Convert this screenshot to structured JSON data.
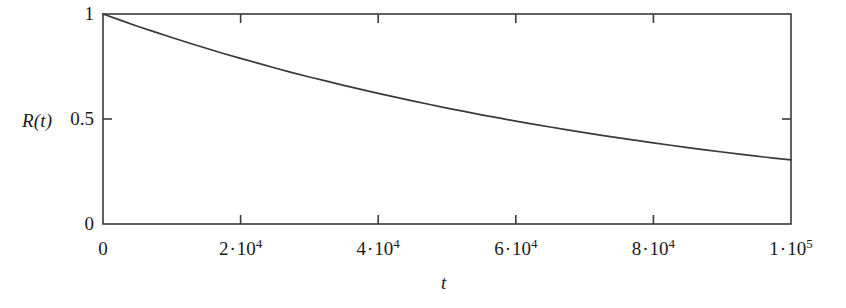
{
  "chart_data": {
    "type": "line",
    "title": "",
    "subtitle": "",
    "xlabel": "t",
    "ylabel": "R(t)",
    "xlim": [
      0,
      100000
    ],
    "ylim": [
      0,
      1
    ],
    "grid": false,
    "legend": null,
    "x_tick_values": [
      0,
      20000,
      40000,
      60000,
      80000,
      100000
    ],
    "x_tick_labels": [
      {
        "mantissa": "0",
        "dot": "",
        "power": "",
        "exponent": ""
      },
      {
        "mantissa": "2",
        "dot": "·",
        "power": "10",
        "exponent": "4"
      },
      {
        "mantissa": "4",
        "dot": "·",
        "power": "10",
        "exponent": "4"
      },
      {
        "mantissa": "6",
        "dot": "·",
        "power": "10",
        "exponent": "4"
      },
      {
        "mantissa": "8",
        "dot": "·",
        "power": "10",
        "exponent": "4"
      },
      {
        "mantissa": "1",
        "dot": "·",
        "power": "10",
        "exponent": "5"
      }
    ],
    "y_tick_values": [
      0,
      0.5,
      1
    ],
    "y_tick_labels": [
      "0",
      "0.5",
      "1"
    ],
    "series": [
      {
        "name": "R(t)",
        "color": "#3a3a3a",
        "x": [
          0,
          2500,
          5000,
          7500,
          10000,
          12500,
          15000,
          17500,
          20000,
          22500,
          25000,
          27500,
          30000,
          32500,
          35000,
          37500,
          40000,
          42500,
          45000,
          47500,
          50000,
          52500,
          55000,
          57500,
          60000,
          62500,
          65000,
          67500,
          70000,
          72500,
          75000,
          77500,
          80000,
          82500,
          85000,
          87500,
          90000,
          92500,
          95000,
          97500,
          100000
        ],
        "values": [
          1.0,
          0.971,
          0.942,
          0.915,
          0.888,
          0.862,
          0.837,
          0.812,
          0.789,
          0.766,
          0.743,
          0.721,
          0.7,
          0.68,
          0.66,
          0.641,
          0.622,
          0.604,
          0.586,
          0.569,
          0.552,
          0.536,
          0.52,
          0.505,
          0.49,
          0.476,
          0.462,
          0.448,
          0.435,
          0.422,
          0.41,
          0.398,
          0.386,
          0.375,
          0.364,
          0.353,
          0.343,
          0.333,
          0.323,
          0.314,
          0.305
        ]
      }
    ],
    "annotations": []
  },
  "axes": {
    "y_title": "R(t)",
    "x_title": "t",
    "frame_color": "#3a3a3a"
  }
}
